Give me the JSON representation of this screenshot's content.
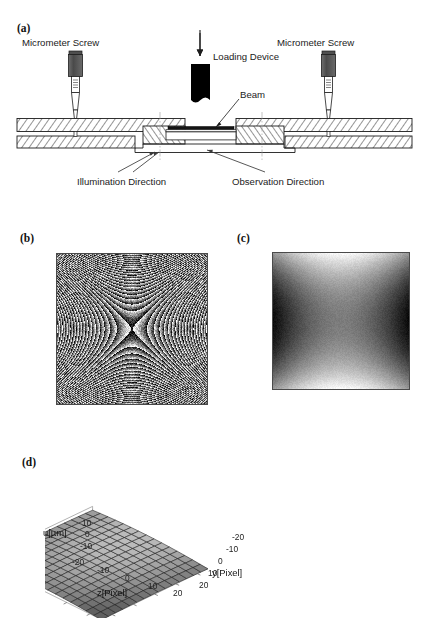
{
  "figure": {
    "panels": [
      {
        "id": "a",
        "letter": "(a)",
        "caption": "experimental setup cross-section"
      },
      {
        "id": "b",
        "letter": "(b)",
        "caption": "wrapped phase fringe map"
      },
      {
        "id": "c",
        "letter": "(c)",
        "caption": "unwrapped phase map"
      },
      {
        "id": "d",
        "letter": "(d)",
        "caption": "reconstructed displacement surface"
      }
    ]
  },
  "panel_a": {
    "labels": {
      "micrometer_screw_left": "Micrometer Screw",
      "micrometer_screw_right": "Micrometer Screw",
      "loading_device": "Loading Device",
      "beam": "Beam",
      "illumination_direction": "Illumination Direction",
      "observation_direction": "Observation Direction"
    },
    "colors": {
      "loading_device_fill": "#000000",
      "screw_body_fill": "#585858",
      "plate_hatch": "#2b2b2b",
      "beam_fill": "#1a1a1a",
      "outline": "#1c1c1c"
    }
  },
  "panel_b": {
    "description": "wrapped phase sawtooth fringes, saddle shaped",
    "colors": {
      "low": "#070707",
      "high": "#f2f2f2",
      "border": "#4a4a4a"
    }
  },
  "panel_c": {
    "description": "unwrapped phase, smooth saddle with bright top and bottom",
    "colors": {
      "low": "#060606",
      "high": "#fbfbfb",
      "border": "#4a4a4a"
    }
  },
  "chart_data": {
    "type": "surface",
    "title": "",
    "zlabel": "u[µm]",
    "xlabel": "z[Pixel]",
    "ylabel": "y[Pixel]",
    "z_ticks": [
      10,
      0,
      -10
    ],
    "z_tick_labels": [
      "10",
      "0",
      "-10"
    ],
    "x_ticks": [
      -20,
      -10,
      0,
      10,
      20
    ],
    "x_tick_labels": [
      "-20",
      "-10",
      "0",
      "10",
      "20"
    ],
    "y_ticks": [
      -20,
      -10,
      0,
      10,
      20
    ],
    "y_tick_labels": [
      "-20",
      "-10",
      "0",
      "10",
      "20"
    ],
    "zlim": [
      -10,
      10
    ],
    "xlim": [
      -25,
      25
    ],
    "ylim": [
      -25,
      25
    ],
    "grid": true,
    "legend": false,
    "mesh_n": 15,
    "surface_color": "#b4b4b4",
    "mesh_color": "#1a1a1a",
    "note": "saddle-like deflection surface u(z,y); ridge along z rising toward -z edge, falling at +z"
  }
}
